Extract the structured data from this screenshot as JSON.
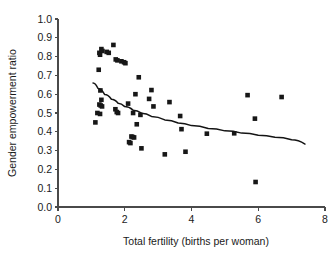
{
  "chart_data": {
    "type": "scatter",
    "title": "",
    "xlabel": "Total fertility (births per woman)",
    "ylabel": "Gender empowerment ratio",
    "xlim": [
      0,
      8
    ],
    "ylim": [
      0.0,
      1.0
    ],
    "xticks": [
      "0",
      "2",
      "4",
      "6",
      "8"
    ],
    "xtick_values": [
      0,
      2,
      4,
      6,
      8
    ],
    "yticks": [
      "0.0",
      "0.1",
      "0.2",
      "0.3",
      "0.4",
      "0.5",
      "0.6",
      "0.7",
      "0.8",
      "0.9",
      "1.0"
    ],
    "ytick_values": [
      0.0,
      0.1,
      0.2,
      0.3,
      0.4,
      0.5,
      0.6,
      0.7,
      0.8,
      0.9,
      1.0
    ],
    "grid": false,
    "legend": null,
    "marker": "filled-square",
    "marker_color": "#171717",
    "points": [
      {
        "x": 1.12,
        "y": 0.45
      },
      {
        "x": 1.18,
        "y": 0.5
      },
      {
        "x": 1.22,
        "y": 0.73
      },
      {
        "x": 1.24,
        "y": 0.82
      },
      {
        "x": 1.3,
        "y": 0.84
      },
      {
        "x": 1.33,
        "y": 0.83
      },
      {
        "x": 1.26,
        "y": 0.81
      },
      {
        "x": 1.27,
        "y": 0.62
      },
      {
        "x": 1.3,
        "y": 0.57
      },
      {
        "x": 1.24,
        "y": 0.545
      },
      {
        "x": 1.28,
        "y": 0.54
      },
      {
        "x": 1.32,
        "y": 0.535
      },
      {
        "x": 1.26,
        "y": 0.495
      },
      {
        "x": 1.46,
        "y": 0.825
      },
      {
        "x": 1.52,
        "y": 0.82
      },
      {
        "x": 1.66,
        "y": 0.862
      },
      {
        "x": 1.73,
        "y": 0.785
      },
      {
        "x": 1.78,
        "y": 0.78
      },
      {
        "x": 1.72,
        "y": 0.52
      },
      {
        "x": 1.76,
        "y": 0.505
      },
      {
        "x": 1.8,
        "y": 0.5
      },
      {
        "x": 1.9,
        "y": 0.775
      },
      {
        "x": 1.98,
        "y": 0.77
      },
      {
        "x": 2.02,
        "y": 0.765
      },
      {
        "x": 2.1,
        "y": 0.55
      },
      {
        "x": 2.13,
        "y": 0.345
      },
      {
        "x": 2.17,
        "y": 0.34
      },
      {
        "x": 2.2,
        "y": 0.375
      },
      {
        "x": 2.24,
        "y": 0.372
      },
      {
        "x": 2.28,
        "y": 0.37
      },
      {
        "x": 2.25,
        "y": 0.5
      },
      {
        "x": 2.32,
        "y": 0.6
      },
      {
        "x": 2.36,
        "y": 0.44
      },
      {
        "x": 2.42,
        "y": 0.69
      },
      {
        "x": 2.47,
        "y": 0.49
      },
      {
        "x": 2.5,
        "y": 0.312
      },
      {
        "x": 2.73,
        "y": 0.575
      },
      {
        "x": 2.8,
        "y": 0.622
      },
      {
        "x": 2.86,
        "y": 0.535
      },
      {
        "x": 3.2,
        "y": 0.28
      },
      {
        "x": 3.34,
        "y": 0.558
      },
      {
        "x": 3.66,
        "y": 0.484
      },
      {
        "x": 3.7,
        "y": 0.414
      },
      {
        "x": 3.82,
        "y": 0.294
      },
      {
        "x": 4.46,
        "y": 0.39
      },
      {
        "x": 5.28,
        "y": 0.392
      },
      {
        "x": 5.68,
        "y": 0.595
      },
      {
        "x": 5.9,
        "y": 0.47
      },
      {
        "x": 5.92,
        "y": 0.133
      },
      {
        "x": 6.7,
        "y": 0.585
      }
    ],
    "fit_curve": {
      "label": "fitted trend",
      "x": [
        1.05,
        1.2,
        1.4,
        1.6,
        1.8,
        2.0,
        2.25,
        2.5,
        2.8,
        3.2,
        3.6,
        4.0,
        4.5,
        5.0,
        5.5,
        6.0,
        6.5,
        7.0,
        7.4
      ],
      "y": [
        0.66,
        0.63,
        0.598,
        0.573,
        0.552,
        0.534,
        0.515,
        0.499,
        0.482,
        0.463,
        0.447,
        0.433,
        0.418,
        0.405,
        0.393,
        0.382,
        0.371,
        0.358,
        0.335
      ]
    }
  }
}
